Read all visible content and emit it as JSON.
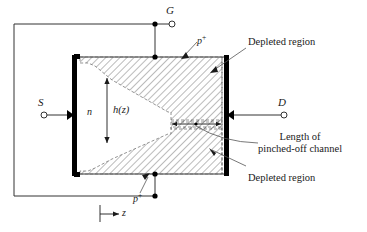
{
  "figure": {
    "kind": "jfet-pinchoff-cross-section",
    "title": "",
    "colors": {
      "ink": "#1a1a1a",
      "line": "#333333",
      "contact_fill": "#000000",
      "hatch": "#555555",
      "background": "#ffffff"
    },
    "terminals": [
      {
        "id": "gate",
        "label": "G",
        "data_name": "terminal-gate"
      },
      {
        "id": "source",
        "label": "S",
        "data_name": "terminal-source"
      },
      {
        "id": "drain",
        "label": "D",
        "data_name": "terminal-drain"
      }
    ],
    "region_labels": {
      "channel": "n",
      "gate_top": "p",
      "gate_top_sup": "+",
      "gate_bottom": "p",
      "gate_bottom_sup": "+",
      "channel_height": "h(z)",
      "axis": "z"
    },
    "callouts": [
      {
        "id": "depleted-top",
        "text": "Depleted region",
        "data_name": "callout-depleted-region-top"
      },
      {
        "id": "pinched-off-length",
        "line1": "Length of",
        "line2": "pinched-off channel",
        "data_name": "callout-pinched-off-channel-length"
      },
      {
        "id": "depleted-bottom",
        "text": "Depleted region",
        "data_name": "callout-depleted-region-bottom"
      }
    ]
  }
}
